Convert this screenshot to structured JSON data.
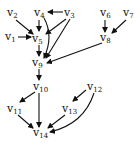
{
  "diagram": {
    "type": "directed-graph",
    "nodes": [
      {
        "id": "v1",
        "label": "v",
        "sub": "1",
        "x": 5,
        "y": 40
      },
      {
        "id": "v2",
        "label": "v",
        "sub": "2",
        "x": 7,
        "y": 16
      },
      {
        "id": "v3",
        "label": "v",
        "sub": "3",
        "x": 64,
        "y": 16
      },
      {
        "id": "v4",
        "label": "v",
        "sub": "4",
        "x": 34,
        "y": 16
      },
      {
        "id": "v5",
        "label": "v",
        "sub": "5",
        "x": 32,
        "y": 42
      },
      {
        "id": "v6",
        "label": "v",
        "sub": "6",
        "x": 100,
        "y": 16
      },
      {
        "id": "v7",
        "label": "v",
        "sub": "7",
        "x": 123,
        "y": 16
      },
      {
        "id": "v8",
        "label": "v",
        "sub": "8",
        "x": 100,
        "y": 41
      },
      {
        "id": "v9",
        "label": "v",
        "sub": "9",
        "x": 32,
        "y": 66
      },
      {
        "id": "v10",
        "label": "v",
        "sub": "10",
        "x": 33,
        "y": 90
      },
      {
        "id": "v11",
        "label": "v",
        "sub": "11",
        "x": 7,
        "y": 112
      },
      {
        "id": "v12",
        "label": "v",
        "sub": "12",
        "x": 87,
        "y": 90
      },
      {
        "id": "v13",
        "label": "v",
        "sub": "13",
        "x": 62,
        "y": 112
      },
      {
        "id": "v14",
        "label": "v",
        "sub": "14",
        "x": 33,
        "y": 136
      }
    ],
    "edges": [
      {
        "from": "v2",
        "to": "v5",
        "d": "M16,20 L33,34"
      },
      {
        "from": "v1",
        "to": "v5",
        "d": "M18,37 L31,37"
      },
      {
        "from": "v4",
        "to": "v5",
        "d": "M39,20 L39,31"
      },
      {
        "from": "v3",
        "to": "v4",
        "d": "M63,12 L48,12"
      },
      {
        "from": "v3",
        "to": "v5",
        "d": "M66,19 L46,34"
      },
      {
        "from": "v3",
        "to": "v9",
        "d": "M70,19 L46,58"
      },
      {
        "from": "v4",
        "to": "v9",
        "d": "M44,18 Q54,36 44,58"
      },
      {
        "from": "v5",
        "to": "v9",
        "d": "M39,45 L39,56"
      },
      {
        "from": "v6",
        "to": "v8",
        "d": "M105,20 L105,32"
      },
      {
        "from": "v7",
        "to": "v8",
        "d": "M126,20 L112,33"
      },
      {
        "from": "v8",
        "to": "v9",
        "d": "M102,43 L47,63"
      },
      {
        "from": "v9",
        "to": "v10",
        "d": "M39,69 L39,80"
      },
      {
        "from": "v10",
        "to": "v11",
        "d": "M35,92 L20,102"
      },
      {
        "from": "v10",
        "to": "v14",
        "d": "M39,93 L39,127"
      },
      {
        "from": "v11",
        "to": "v14",
        "d": "M18,115 L33,128"
      },
      {
        "from": "v12",
        "to": "v13",
        "d": "M86,90 L73,101"
      },
      {
        "from": "v13",
        "to": "v14",
        "d": "M65,115 L48,128"
      },
      {
        "from": "v12",
        "to": "v14",
        "d": "M94,93 Q84,124 50,132"
      }
    ]
  }
}
